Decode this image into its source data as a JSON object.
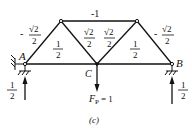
{
  "figure": {
    "caption": "(c)",
    "nodes": {
      "A": {
        "label": "A"
      },
      "B": {
        "label": "B"
      },
      "C": {
        "label": "C"
      }
    },
    "members": {
      "top_chord": {
        "value": "-1"
      },
      "left_diagonal": {
        "sign": "-",
        "num": "√2",
        "den": "2"
      },
      "inner_left_diagonal": {
        "num": "√2",
        "den": "2"
      },
      "inner_right_diagonal": {
        "num": "√2",
        "den": "2"
      },
      "right_diagonal": {
        "sign": "-",
        "num": "√2",
        "den": "2"
      },
      "bottom_left": {
        "num": "1",
        "den": "2"
      },
      "bottom_right": {
        "num": "1",
        "den": "2"
      }
    },
    "load": {
      "label": "F",
      "subscript": "P",
      "value": "= 1"
    },
    "reactions": {
      "A": {
        "num": "1",
        "den": "2"
      },
      "B": {
        "num": "1",
        "den": "2"
      }
    }
  }
}
